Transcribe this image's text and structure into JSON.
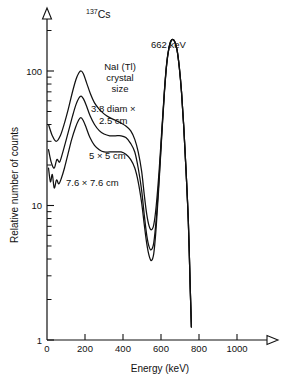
{
  "chart_data": {
    "type": "line",
    "title": "137Cs",
    "title_superscript": "137",
    "title_element": "Cs",
    "xlabel": "Energy (keV)",
    "ylabel": "Relative number of counts",
    "xlim": [
      0,
      1200
    ],
    "ylim": [
      1,
      250
    ],
    "yscale": "log",
    "xscale": "linear",
    "grid": false,
    "legend_position": "inline-annotations",
    "x_ticks": [
      0,
      200,
      400,
      600,
      800,
      1000
    ],
    "x_tick_labels": [
      "0",
      "200",
      "400",
      "600",
      "800",
      "1000"
    ],
    "y_ticks": [
      1,
      10,
      100
    ],
    "y_tick_labels": [
      "1",
      "10",
      "100"
    ],
    "y_minor_ticks": [
      2,
      3,
      4,
      5,
      6,
      7,
      8,
      9,
      20,
      30,
      40,
      50,
      60,
      70,
      80,
      90,
      200
    ],
    "annotations": [
      {
        "name": "photopeak-label",
        "text": "662 keV",
        "x": 662,
        "y": 200
      },
      {
        "name": "crystal-size-header",
        "text": "NaI (Tl)",
        "x": 430,
        "y": 120
      },
      {
        "name": "crystal-size-header-2",
        "text": "crystal",
        "x": 430,
        "y": 95
      },
      {
        "name": "crystal-size-header-3",
        "text": "size",
        "x": 430,
        "y": 78
      },
      {
        "name": "curve-label-small",
        "text": "3.8 diam ×",
        "x": 400,
        "y": 50
      },
      {
        "name": "curve-label-small-2",
        "text": "2.5 cm",
        "x": 410,
        "y": 40
      },
      {
        "name": "curve-label-medium",
        "text": "5 × 5 cm",
        "x": 380,
        "y": 19
      },
      {
        "name": "curve-label-large",
        "text": "7.6 × 7.6 cm",
        "x": 300,
        "y": 13
      }
    ],
    "series": [
      {
        "name": "3.8 diam × 2.5 cm",
        "label": "3.8 diam × 2.5 cm",
        "color": "#111111",
        "points": [
          [
            8,
            40
          ],
          [
            28,
            33
          ],
          [
            48,
            30
          ],
          [
            70,
            33
          ],
          [
            92,
            41
          ],
          [
            112,
            52
          ],
          [
            132,
            68
          ],
          [
            152,
            86
          ],
          [
            168,
            97
          ],
          [
            180,
            100
          ],
          [
            192,
            95
          ],
          [
            208,
            82
          ],
          [
            228,
            68
          ],
          [
            250,
            58
          ],
          [
            275,
            52
          ],
          [
            300,
            48
          ],
          [
            330,
            45
          ],
          [
            360,
            43
          ],
          [
            390,
            41
          ],
          [
            415,
            39
          ],
          [
            440,
            36
          ],
          [
            462,
            31
          ],
          [
            480,
            25
          ],
          [
            498,
            18
          ],
          [
            512,
            12
          ],
          [
            525,
            8.6
          ],
          [
            538,
            7.0
          ],
          [
            550,
            6.6
          ],
          [
            562,
            7.2
          ],
          [
            575,
            10
          ],
          [
            590,
            18
          ],
          [
            605,
            38
          ],
          [
            618,
            72
          ],
          [
            630,
            115
          ],
          [
            642,
            150
          ],
          [
            652,
            168
          ],
          [
            662,
            172
          ],
          [
            672,
            166
          ],
          [
            684,
            145
          ],
          [
            696,
            108
          ],
          [
            708,
            70
          ],
          [
            720,
            38
          ],
          [
            732,
            18
          ],
          [
            744,
            7.5
          ],
          [
            754,
            2.4
          ],
          [
            760,
            1.25
          ]
        ]
      },
      {
        "name": "5 × 5 cm",
        "label": "5 × 5 cm",
        "color": "#111111",
        "points": [
          [
            8,
            26
          ],
          [
            22,
            21
          ],
          [
            38,
            19
          ],
          [
            52,
            22
          ],
          [
            66,
            21
          ],
          [
            80,
            24
          ],
          [
            96,
            29
          ],
          [
            114,
            36
          ],
          [
            134,
            46
          ],
          [
            152,
            56
          ],
          [
            168,
            63
          ],
          [
            180,
            65
          ],
          [
            192,
            62
          ],
          [
            208,
            55
          ],
          [
            228,
            46
          ],
          [
            250,
            40
          ],
          [
            275,
            36
          ],
          [
            300,
            34
          ],
          [
            330,
            33
          ],
          [
            360,
            33
          ],
          [
            390,
            33
          ],
          [
            415,
            32
          ],
          [
            440,
            29
          ],
          [
            462,
            25
          ],
          [
            480,
            19
          ],
          [
            498,
            13
          ],
          [
            512,
            8.5
          ],
          [
            525,
            6.0
          ],
          [
            538,
            4.9
          ],
          [
            550,
            4.7
          ],
          [
            562,
            5.3
          ],
          [
            575,
            8
          ],
          [
            590,
            16
          ],
          [
            605,
            36
          ],
          [
            618,
            70
          ],
          [
            630,
            113
          ],
          [
            642,
            149
          ],
          [
            652,
            167
          ],
          [
            662,
            172
          ],
          [
            672,
            166
          ],
          [
            684,
            145
          ],
          [
            696,
            108
          ],
          [
            708,
            70
          ],
          [
            720,
            38
          ],
          [
            732,
            18
          ],
          [
            744,
            7.5
          ],
          [
            754,
            2.4
          ],
          [
            760,
            1.25
          ]
        ]
      },
      {
        "name": "7.6 × 7.6 cm",
        "label": "7.6 × 7.6 cm",
        "color": "#111111",
        "points": [
          [
            8,
            19
          ],
          [
            18,
            15
          ],
          [
            28,
            17
          ],
          [
            38,
            13.5
          ],
          [
            50,
            15.5
          ],
          [
            62,
            14.5
          ],
          [
            76,
            16
          ],
          [
            92,
            19
          ],
          [
            110,
            24
          ],
          [
            130,
            31
          ],
          [
            150,
            38
          ],
          [
            166,
            43
          ],
          [
            178,
            45
          ],
          [
            190,
            43
          ],
          [
            206,
            38
          ],
          [
            226,
            32
          ],
          [
            250,
            28
          ],
          [
            275,
            26
          ],
          [
            300,
            25
          ],
          [
            330,
            25
          ],
          [
            360,
            25
          ],
          [
            390,
            25
          ],
          [
            415,
            24
          ],
          [
            440,
            22
          ],
          [
            462,
            19
          ],
          [
            480,
            15
          ],
          [
            498,
            10.5
          ],
          [
            512,
            7.2
          ],
          [
            525,
            5.2
          ],
          [
            538,
            4.2
          ],
          [
            550,
            3.9
          ],
          [
            562,
            4.4
          ],
          [
            575,
            7
          ],
          [
            590,
            15
          ],
          [
            605,
            35
          ],
          [
            618,
            69
          ],
          [
            630,
            112
          ],
          [
            642,
            148
          ],
          [
            652,
            166
          ],
          [
            662,
            171
          ],
          [
            672,
            165
          ],
          [
            684,
            144
          ],
          [
            696,
            107
          ],
          [
            708,
            69
          ],
          [
            720,
            38
          ],
          [
            732,
            18
          ],
          [
            744,
            7.5
          ],
          [
            754,
            2.4
          ],
          [
            760,
            1.25
          ]
        ]
      }
    ]
  },
  "axes": {
    "x_axis_name": "Energy (keV)",
    "y_axis_name": "Relative number of counts"
  }
}
